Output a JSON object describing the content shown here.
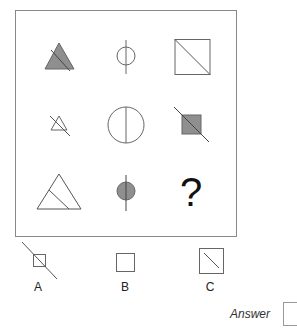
{
  "puzzle": {
    "type": "3x3 matrix reasoning",
    "colors": {
      "stroke": "#555555",
      "fill": "#8f8f8f",
      "frame": "#888888"
    },
    "grid": [
      [
        "filled-triangle-with-diagonal-line",
        "small-circle-with-vertical-line",
        "square-with-corner-diagonal"
      ],
      [
        "small-outline-triangle-with-diagonal-line",
        "large-circle-with-vertical-line",
        "filled-square-with-diagonal-line"
      ],
      [
        "large-outline-triangle-with-inner-line",
        "filled-circle-with-vertical-line",
        "missing"
      ]
    ],
    "missing_symbol": "?"
  },
  "options": [
    {
      "label": "A",
      "shape": "small-square-with-long-diagonal-line"
    },
    {
      "label": "B",
      "shape": "plain-square"
    },
    {
      "label": "C",
      "shape": "square-with-inner-diagonal"
    }
  ],
  "answer": {
    "label": "Answer",
    "value": ""
  }
}
